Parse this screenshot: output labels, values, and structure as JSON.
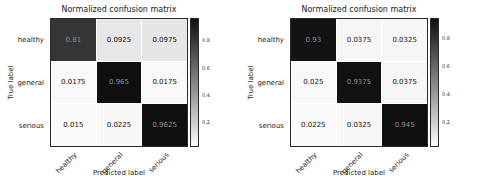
{
  "chart_data": [
    {
      "type": "heatmap",
      "title": "Normalized confusion matrix",
      "xlabel": "Predicted label",
      "ylabel": "True label",
      "x_categories": [
        "healthy",
        "general",
        "serious"
      ],
      "y_categories": [
        "healthy",
        "general",
        "serious"
      ],
      "values": [
        [
          0.81,
          0.0925,
          0.0975
        ],
        [
          0.0175,
          0.965,
          0.0175
        ],
        [
          0.015,
          0.0225,
          0.9625
        ]
      ],
      "value_labels": [
        [
          "0.81",
          "0.0925",
          "0.0975"
        ],
        [
          "0.0175",
          "0.965",
          "0.0175"
        ],
        [
          "0.015",
          "0.0225",
          "0.9625"
        ]
      ],
      "colormap": "Greys (low=white, high=black)",
      "colorbar_ticks": [
        0.8,
        0.6,
        0.4,
        0.2
      ],
      "colorbar_tick_labels": [
        "0.8",
        "0.6",
        "0.4",
        "0.2"
      ],
      "legend_position": "right colorbar",
      "grid": false
    },
    {
      "type": "heatmap",
      "title": "Normalized confusion matrix",
      "xlabel": "Predicted label",
      "ylabel": "True label",
      "x_categories": [
        "healthy",
        "general",
        "serious"
      ],
      "y_categories": [
        "healthy",
        "general",
        "serious"
      ],
      "values": [
        [
          0.93,
          0.0375,
          0.0325
        ],
        [
          0.025,
          0.9375,
          0.0375
        ],
        [
          0.0225,
          0.0325,
          0.945
        ]
      ],
      "value_labels": [
        [
          "0.93",
          "0.0375",
          "0.0325"
        ],
        [
          "0.025",
          "0.9375",
          "0.0375"
        ],
        [
          "0.0225",
          "0.0325",
          "0.945"
        ]
      ],
      "colormap": "Greys (low=white, high=black)",
      "colorbar_ticks": [
        0.8,
        0.6,
        0.4,
        0.2
      ],
      "colorbar_tick_labels": [
        "0.8",
        "0.6",
        "0.4",
        "0.2"
      ],
      "legend_position": "right colorbar",
      "grid": false
    }
  ],
  "colors": {
    "background": "#ffffff",
    "cell_low": "#fafafa",
    "cell_high": "#0f0f0f",
    "dark_cell_text": "#8f8f8f",
    "light_cell_text": "#111111",
    "axes_border": "#2b2b2b"
  }
}
